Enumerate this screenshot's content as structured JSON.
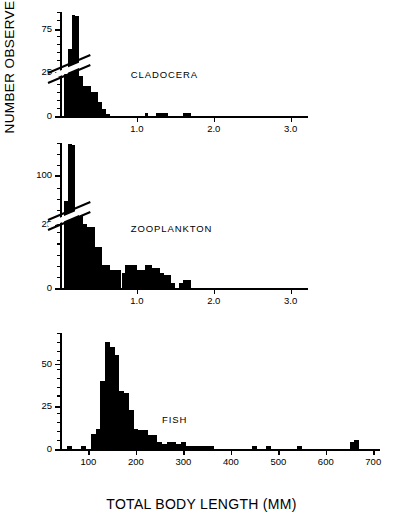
{
  "figure": {
    "y_axis_label": "NUMBER OBSERVED",
    "x_axis_label": "TOTAL BODY LENGTH (MM)",
    "ink_color": "#000000",
    "background_color": "#ffffff"
  },
  "chart_data": [
    {
      "type": "bar",
      "title": "CLADOCERA",
      "xlabel": "",
      "ylabel": "NUMBER OBSERVED",
      "xlim": [
        0,
        3.2
      ],
      "ylim": [
        0,
        95
      ],
      "axis_break": true,
      "axis_break_note": "y-axis broken between 25 and 75",
      "grid": false,
      "xticks": [
        1.0,
        2.0,
        3.0
      ],
      "xticklabels": [
        "1.0",
        "2.0",
        "3.0"
      ],
      "yticks": [
        0,
        25,
        75
      ],
      "yticklabels": [
        "0",
        "25",
        "75"
      ],
      "bin_width": 0.05,
      "x": [
        0.05,
        0.1,
        0.15,
        0.2,
        0.25,
        0.3,
        0.35,
        0.4,
        0.45,
        0.5,
        0.55,
        0.6,
        1.1,
        1.25,
        1.3,
        1.35,
        1.6,
        1.65
      ],
      "values": [
        24,
        52,
        91,
        90,
        23,
        17,
        17,
        14,
        14,
        8,
        4,
        1,
        2,
        2,
        2,
        2,
        2,
        2
      ]
    },
    {
      "type": "bar",
      "title": "ZOOPLANKTON",
      "xlabel": "",
      "ylabel": "NUMBER OBSERVED",
      "xlim": [
        0,
        3.2
      ],
      "ylim": [
        0,
        150
      ],
      "axis_break": true,
      "axis_break_note": "y-axis broken between 25 and 100",
      "grid": false,
      "xticks": [
        1.0,
        2.0,
        3.0
      ],
      "xticklabels": [
        "1.0",
        "2.0",
        "3.0"
      ],
      "yticks": [
        0,
        25,
        100
      ],
      "yticklabels": [
        "0",
        "25",
        "100"
      ],
      "bin_width": 0.05,
      "x": [
        0.05,
        0.1,
        0.15,
        0.2,
        0.25,
        0.3,
        0.35,
        0.4,
        0.45,
        0.5,
        0.55,
        0.6,
        0.65,
        0.7,
        0.75,
        0.8,
        0.85,
        0.9,
        0.95,
        1.0,
        1.05,
        1.1,
        1.15,
        1.2,
        1.25,
        1.3,
        1.35,
        1.4,
        1.45,
        1.55,
        1.6,
        1.65
      ],
      "values": [
        60,
        148,
        147,
        41,
        38,
        25,
        24,
        24,
        16,
        16,
        9,
        9,
        7,
        7,
        7,
        6,
        9,
        9,
        9,
        7,
        7,
        9,
        9,
        8,
        8,
        6,
        5,
        5,
        2,
        2,
        3,
        3
      ]
    },
    {
      "type": "bar",
      "title": "FISH",
      "xlabel": "TOTAL BODY LENGTH (MM)",
      "ylabel": "NUMBER OBSERVED",
      "xlim": [
        40,
        710
      ],
      "ylim": [
        0,
        68
      ],
      "axis_break": false,
      "grid": false,
      "xticks": [
        100,
        200,
        300,
        400,
        500,
        600,
        700
      ],
      "xticklabels": [
        "100",
        "200",
        "300",
        "400",
        "500",
        "600",
        "700"
      ],
      "yticks": [
        0,
        25,
        50
      ],
      "yticklabels": [
        "0",
        "25",
        "50"
      ],
      "bin_width": 10,
      "x": [
        55,
        85,
        105,
        115,
        125,
        135,
        145,
        155,
        165,
        175,
        185,
        195,
        205,
        215,
        225,
        235,
        245,
        255,
        265,
        275,
        285,
        295,
        305,
        315,
        325,
        335,
        345,
        355,
        445,
        475,
        540,
        650,
        660
      ],
      "values": [
        2,
        2,
        9,
        12,
        40,
        63,
        60,
        55,
        34,
        33,
        23,
        12,
        11,
        11,
        8,
        8,
        4,
        3,
        4,
        4,
        3,
        4,
        2,
        2,
        2,
        2,
        2,
        2,
        2,
        2,
        2,
        4,
        5
      ]
    }
  ]
}
